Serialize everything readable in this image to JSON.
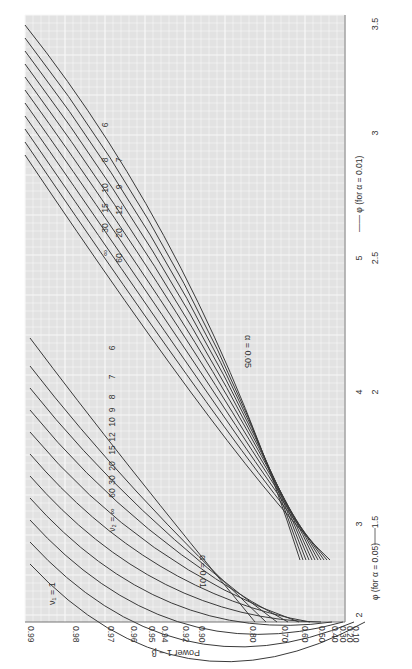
{
  "chart_data": {
    "type": "line",
    "orientation": "rotated 90° (power axis along bottom edge, phi axis along right edge)",
    "nu1_label": "ν₁ = 1",
    "ylabel": "Power 1 − β",
    "power_ticks": [
      "0.10",
      "0.20",
      "0.30",
      "0.40",
      "0.50",
      "0.60",
      "0.70",
      "0.80",
      "0.90",
      "0.92",
      "0.94",
      "0.95",
      "0.96",
      "0.97",
      "0.98",
      "0.99"
    ],
    "power_tick_values": [
      0.1,
      0.2,
      0.3,
      0.4,
      0.5,
      0.6,
      0.7,
      0.8,
      0.9,
      0.92,
      0.94,
      0.95,
      0.96,
      0.97,
      0.98,
      0.99
    ],
    "xlabel_alpha05": "φ (for α = 0.05)",
    "xlabel_alpha01": "φ (for α = 0.01)",
    "phi_ticks_alpha05": [
      "1",
      "2",
      "3",
      "4",
      "5"
    ],
    "phi_ticks_alpha01": [
      "2",
      "2.5",
      "3",
      "3.5"
    ],
    "phi_ticks_alpha05_raw": [
      "1.5",
      "2",
      "2.5",
      "3"
    ],
    "phi_ticks_alpha01_raw": [
      "2",
      "3",
      "4",
      "5"
    ],
    "axis_labels_visible": {
      "outer_row": [
        "2",
        "3",
        "4",
        "5"
      ],
      "inner_row": [
        "1.5",
        "2",
        "2.5",
        "3",
        "3.5"
      ]
    },
    "arrow_left_label": "φ (for α = 0.05) ——→ 1.5",
    "arrow_right_label": "5 ←—— φ (for α = 0.01)",
    "curve_group_labels": {
      "alpha_05": "α = 0.05",
      "alpha_01": "α = 0.01"
    },
    "nu2_prefix": "ν₂ =",
    "nu2_values": [
      "∞",
      "60",
      "30",
      "20",
      "15",
      "12",
      "10",
      "9",
      "8",
      "7",
      "6"
    ],
    "series": [
      {
        "name": "α=0.05, ν₂=6",
        "nu2": "6",
        "group": "0.05"
      },
      {
        "name": "α=0.05, ν₂=7",
        "nu2": "7",
        "group": "0.05"
      },
      {
        "name": "α=0.05, ν₂=8",
        "nu2": "8",
        "group": "0.05"
      },
      {
        "name": "α=0.05, ν₂=9",
        "nu2": "9",
        "group": "0.05"
      },
      {
        "name": "α=0.05, ν₂=10",
        "nu2": "10",
        "group": "0.05"
      },
      {
        "name": "α=0.05, ν₂=12",
        "nu2": "12",
        "group": "0.05"
      },
      {
        "name": "α=0.05, ν₂=15",
        "nu2": "15",
        "group": "0.05"
      },
      {
        "name": "α=0.05, ν₂=20",
        "nu2": "20",
        "group": "0.05"
      },
      {
        "name": "α=0.05, ν₂=30",
        "nu2": "30",
        "group": "0.05"
      },
      {
        "name": "α=0.05, ν₂=60",
        "nu2": "60",
        "group": "0.05"
      },
      {
        "name": "α=0.05, ν₂=∞",
        "nu2": "∞",
        "group": "0.05"
      },
      {
        "name": "α=0.01, ν₂=6",
        "nu2": "6",
        "group": "0.01"
      },
      {
        "name": "α=0.01, ν₂=7",
        "nu2": "7",
        "group": "0.01"
      },
      {
        "name": "α=0.01, ν₂=8",
        "nu2": "8",
        "group": "0.01"
      },
      {
        "name": "α=0.01, ν₂=9",
        "nu2": "9",
        "group": "0.01"
      },
      {
        "name": "α=0.01, ν₂=10",
        "nu2": "10",
        "group": "0.01"
      },
      {
        "name": "α=0.01, ν₂=12",
        "nu2": "12",
        "group": "0.01"
      },
      {
        "name": "α=0.01, ν₂=15",
        "nu2": "15",
        "group": "0.01"
      },
      {
        "name": "α=0.01, ν₂=20",
        "nu2": "20",
        "group": "0.01"
      },
      {
        "name": "α=0.01, ν₂=30",
        "nu2": "30",
        "group": "0.01"
      },
      {
        "name": "α=0.01, ν₂=60",
        "nu2": "60",
        "group": "0.01"
      },
      {
        "name": "α=0.01, ν₂=∞",
        "nu2": "∞",
        "group": "0.01"
      }
    ],
    "grid": true,
    "legend_position": "inline curve labels"
  },
  "labels": {
    "nu1": "ν₁ = 1",
    "power_axis": "Power 1 − β",
    "alpha05": "α = 0.05",
    "alpha01": "α = 0.01",
    "phi05": "φ (for α = 0.05)",
    "phi01": "φ (for α = 0.01)",
    "figure_caption_fragment": "Fi   D.1"
  },
  "colors": {
    "grid_bg": "#e4e4e4",
    "grid_line": "#f8f8f8",
    "curve": "#3a3a3a",
    "text": "#333333"
  }
}
